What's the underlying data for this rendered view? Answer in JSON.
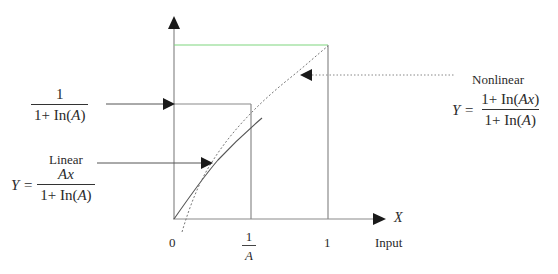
{
  "diagram": {
    "title": "",
    "axes": {
      "x_label": "X",
      "x_caption": "Input",
      "x_ticks": [
        "0",
        "1/A",
        "1"
      ]
    },
    "level_label": {
      "numerator": "1",
      "denominator_prefix": "1+ In(",
      "denominator_var": "A",
      "denominator_suffix": ")"
    },
    "linear": {
      "title": "Linear",
      "lhs": "Y =",
      "numerator": "Ax",
      "denominator_prefix": "1+ In(",
      "denominator_var": "A",
      "denominator_suffix": ")"
    },
    "nonlinear": {
      "title": "Nonlinear",
      "lhs": "Y =",
      "numerator_prefix": "1+ In(",
      "numerator_var": "Ax",
      "numerator_suffix": ")",
      "denominator_prefix": "1+ In(",
      "denominator_var": "A",
      "denominator_suffix": ")"
    },
    "ticks": {
      "zero": "0",
      "inv_a_num": "1",
      "inv_a_den": "A",
      "one": "1"
    },
    "colors": {
      "axis": "#8a8a8a",
      "top_line": "#7fd67f",
      "curve": "#555555",
      "arrow": "#1a1a1a"
    }
  }
}
